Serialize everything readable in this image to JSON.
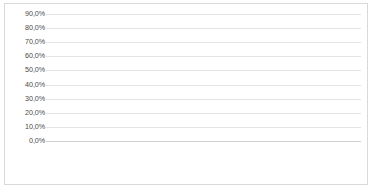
{
  "chart_data": {
    "type": "bar",
    "title": "",
    "xlabel": "",
    "ylabel": "",
    "ylim": [
      0,
      90
    ],
    "grid": true,
    "legend_position": "bottom",
    "categories": [
      "Norte",
      "Nordeste",
      "Sudeste",
      "Sul",
      "Centro-Oeste"
    ],
    "ytick_labels": [
      "0,0%",
      "10,0%",
      "20,0%",
      "30,0%",
      "40,0%",
      "50,0%",
      "60,0%",
      "70,0%",
      "80,0%",
      "90,0%"
    ],
    "ytick_values": [
      0,
      10,
      20,
      30,
      40,
      50,
      60,
      70,
      80,
      90
    ],
    "series": [
      {
        "name": "1966",
        "color": "#111111",
        "values": [
          0.9,
          6.3,
          80.8,
          11.4,
          0.6
        ],
        "labels": [
          "0,9%",
          "6,3%",
          "80,8%",
          "11,4%",
          "0,6%"
        ]
      },
      {
        "name": "1995",
        "color": "#3f3f3f",
        "values": [
          3.8,
          7.4,
          70.9,
          16.4,
          1.6
        ],
        "labels": [
          "3,8%",
          "7,4%",
          "70,9%",
          "16,4%",
          "1,6%"
        ]
      },
      {
        "name": "2007",
        "color": "#848484",
        "values": [
          6.0,
          9.6,
          62.5,
          18.4,
          3.5
        ],
        "labels": [
          "6,0%",
          "9,6%",
          "62,5%",
          "18,4%",
          "3,5%"
        ]
      },
      {
        "name": "2020",
        "color": "#d9d9d9",
        "values": [
          9.3,
          9.5,
          56.3,
          18.7,
          6.3
        ],
        "labels": [
          "9,3%",
          "9,5%",
          "56,3%",
          "18,7%",
          "6,3%"
        ]
      }
    ]
  }
}
